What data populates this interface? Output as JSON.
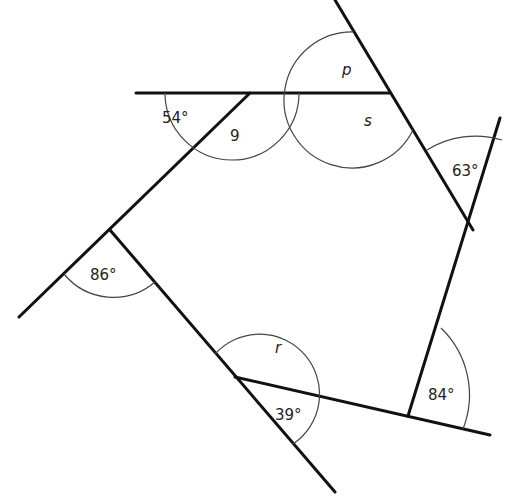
{
  "diagram": {
    "type": "polygon-exterior-angles",
    "colors": {
      "line": "#111111",
      "arc": "#444444",
      "text": "#222222",
      "background": "#ffffff"
    },
    "labels": {
      "angle_54": "54°",
      "angle_q": "9",
      "angle_p": "p",
      "angle_s": "s",
      "angle_63": "63°",
      "angle_86": "86°",
      "angle_r": "r",
      "angle_39": "39°",
      "angle_84": "84°"
    },
    "vertices": [
      {
        "id": "V1",
        "x": 250,
        "y": 93
      },
      {
        "id": "V2",
        "x": 390,
        "y": 93
      },
      {
        "id": "V3",
        "x": 473,
        "y": 230
      },
      {
        "id": "V4",
        "x": 408,
        "y": 416
      },
      {
        "id": "V5",
        "x": 235,
        "y": 377
      },
      {
        "id": "V6",
        "x": 110,
        "y": 230
      }
    ]
  }
}
